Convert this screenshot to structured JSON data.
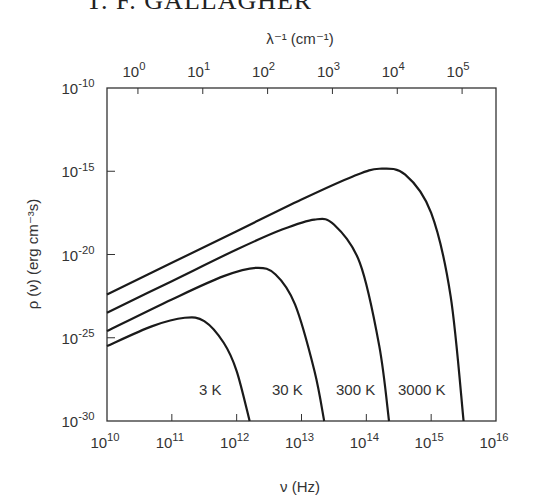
{
  "header": {
    "text": "T. F. GALLAGHER"
  },
  "chart_data": {
    "type": "line",
    "title": "",
    "xlabel": "ν (Hz)",
    "ylabel": "ρ (ν) (erg cm⁻³s)",
    "x2label": "λ⁻¹ (cm⁻¹)",
    "xscale": "log",
    "yscale": "log",
    "xlim": [
      10000000000.0,
      1e+16
    ],
    "ylim": [
      1e-30,
      1e-10
    ],
    "x2lim": [
      0.33,
      330000.0
    ],
    "grid": false,
    "legend": "inline labels near bottom of each curve",
    "xticks": [
      "10^10",
      "10^11",
      "10^12",
      "10^13",
      "10^14",
      "10^15",
      "10^16"
    ],
    "yticks": [
      "10^-10",
      "10^-15",
      "10^-20",
      "10^-25",
      "10^-30"
    ],
    "x2ticks": [
      "10^0",
      "10^1",
      "10^2",
      "10^3",
      "10^4",
      "10^5"
    ],
    "series": [
      {
        "name": "3000 K",
        "log_x": [
          10,
          11,
          12,
          13,
          13.8,
          14.2,
          14.6,
          15.0,
          15.3,
          15.5
        ],
        "log_y": [
          -22.4,
          -20.5,
          -18.6,
          -16.7,
          -15.3,
          -14.85,
          -15.2,
          -17.5,
          -22.5,
          -30
        ]
      },
      {
        "name": "300 K",
        "log_x": [
          10,
          11,
          12,
          12.7,
          13.2,
          13.5,
          13.9,
          14.2,
          14.35
        ],
        "log_y": [
          -23.5,
          -21.6,
          -19.7,
          -18.5,
          -17.9,
          -18.2,
          -20.5,
          -25.5,
          -30
        ]
      },
      {
        "name": "30 K",
        "log_x": [
          10,
          11,
          11.8,
          12.3,
          12.6,
          12.9,
          13.2,
          13.35
        ],
        "log_y": [
          -24.6,
          -22.7,
          -21.3,
          -20.8,
          -21.2,
          -23.0,
          -27.0,
          -30
        ]
      },
      {
        "name": "3 K",
        "log_x": [
          10,
          10.7,
          11.2,
          11.5,
          11.8,
          12.0,
          12.2
        ],
        "log_y": [
          -25.5,
          -24.3,
          -23.8,
          -24.0,
          -25.3,
          -27.0,
          -30
        ]
      }
    ],
    "annotations": [
      "3 K",
      "30 K",
      "300 K",
      "3000 K"
    ]
  }
}
